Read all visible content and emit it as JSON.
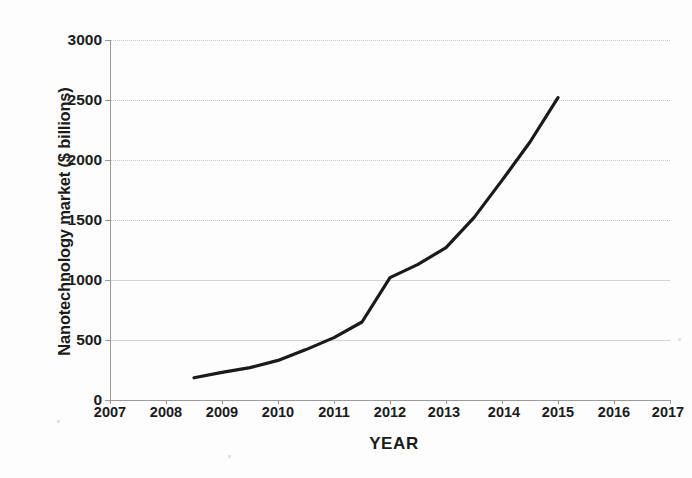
{
  "chart_data": {
    "type": "line",
    "title": "",
    "xlabel": "YEAR",
    "ylabel": "Nanotechnology market ($ billions)",
    "xlim": [
      2007,
      2017
    ],
    "ylim": [
      0,
      3000
    ],
    "xticks": [
      2007,
      2008,
      2009,
      2010,
      2011,
      2012,
      2013,
      2014,
      2015,
      2016,
      2017
    ],
    "xtick_labels": [
      "2007",
      "2008",
      "2009",
      "2010",
      "2011",
      "2012",
      "2013",
      "2014",
      "2015",
      "2016",
      "2017"
    ],
    "yticks": [
      0,
      500,
      1000,
      1500,
      2000,
      2500,
      3000
    ],
    "ytick_labels": [
      "0",
      "500",
      "1000",
      "1500",
      "2000",
      "2500",
      "3000"
    ],
    "grid": true,
    "grid_axis": "y",
    "legend": "none",
    "line_color": "#1a1a1a",
    "line_width": 3,
    "series": [
      {
        "name": "Nanotechnology market",
        "x": [
          2008.5,
          2009,
          2009.5,
          2010,
          2010.5,
          2011,
          2011.5,
          2012,
          2012.5,
          2013,
          2013.5,
          2014,
          2014.5,
          2015
        ],
        "values": [
          185,
          230,
          270,
          330,
          420,
          520,
          650,
          1020,
          1130,
          1270,
          1520,
          1830,
          2150,
          2520
        ]
      }
    ]
  },
  "figure": {
    "background_color": "#fdfdfd",
    "axis_color": "#9a9a9a",
    "gridline_color": "#c8c8c8",
    "text_color": "#1b1b1b"
  }
}
